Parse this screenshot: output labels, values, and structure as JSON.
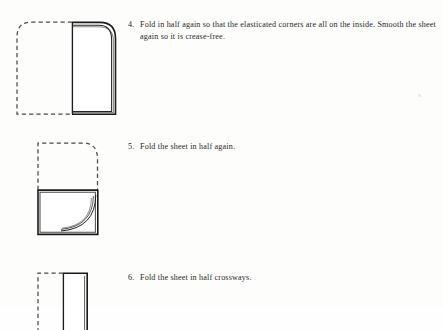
{
  "document": {
    "title": "Fitted Sheet Folding Instructions",
    "background_color": "#fdfdfc",
    "text_color": "#272727",
    "line_color": "#1a1a1a",
    "dash_color": "#4a4a4a"
  },
  "steps": [
    {
      "number": "4.",
      "text": "Fold in half again so that the elasticated corners are all on the\ninside. Smooth the sheet again so it is crease-free.",
      "figure_name": "fold-diagram-step-4",
      "figure_description": "Dashed left half (unfolded position, rounded top-left) beside a solid folded sheet on the right with rounded top-right corner and doubled edge lines showing sheet thickness."
    },
    {
      "number": "5.",
      "text": "Fold the sheet in half again.",
      "figure_name": "fold-diagram-step-5",
      "figure_description": "Dashed upper half with rounded top-right corner above a solid lower rectangle with a curved arc in the bottom-right corner."
    },
    {
      "number": "6.",
      "text": "Fold the sheet in half crossways.",
      "figure_name": "fold-diagram-step-6",
      "figure_description": "Dashed left portion beside a solid narrow rectangle with square top corners, cropped at the bottom edge of the page."
    }
  ],
  "artifacts": {
    "scan_speck": "faint-grey-speck"
  }
}
